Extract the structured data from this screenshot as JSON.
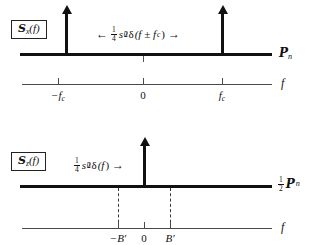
{
  "figure": {
    "background_color": "#ffffff",
    "ink_color": "#111111"
  },
  "panels": [
    {
      "id": "top",
      "label_box": {
        "script_letter": "S",
        "subscript": "x",
        "argument": "(f)",
        "full_text": "Sx(f)"
      },
      "annotation": {
        "left_arrow": "←",
        "right_arrow": "→",
        "numerator": "1",
        "denominator": "4",
        "symbol": "s",
        "symbol_subscript": "0",
        "symbol_superscript": "2",
        "delta": "δ",
        "delta_argument": "(f ± f",
        "delta_arg_subscript": "c",
        "delta_arg_close": ")",
        "full_text": "1/4 s0^2 δ(f ± fc)"
      },
      "level_label": {
        "script_letter": "P",
        "subscript": "n",
        "full_text": "Pn"
      },
      "impulses": [
        {
          "name": "impulse-negative-fc",
          "position_label": "-fc"
        },
        {
          "name": "impulse-positive-fc",
          "position_label": "fc"
        }
      ],
      "frequency_axis": {
        "name": "f",
        "ticks": [
          {
            "label": "−f",
            "subscript": "c",
            "full_text": "-fc"
          },
          {
            "label": "0",
            "subscript": "",
            "full_text": "0"
          },
          {
            "label": "f",
            "subscript": "c",
            "full_text": "fc"
          }
        ]
      }
    },
    {
      "id": "bottom",
      "label_box": {
        "script_letter": "S",
        "subscript": "z",
        "argument": "(f)",
        "full_text": "Sz(f)"
      },
      "annotation": {
        "left_arrow": "",
        "right_arrow": "→",
        "numerator": "1",
        "denominator": "4",
        "symbol": "s",
        "symbol_subscript": "0",
        "symbol_superscript": "2",
        "delta": "δ",
        "delta_argument": "(f",
        "delta_arg_subscript": "",
        "delta_arg_close": ")",
        "full_text": "1/4 s0^2 δ(f)"
      },
      "level_label": {
        "numerator": "1",
        "denominator": "2",
        "script_letter": "P",
        "subscript": "n",
        "full_text": "1/2 Pn"
      },
      "impulses": [
        {
          "name": "impulse-zero",
          "position_label": "0"
        }
      ],
      "frequency_axis": {
        "name": "f",
        "ticks": [
          {
            "label": "−B′",
            "subscript": "",
            "full_text": "-B'"
          },
          {
            "label": "0",
            "subscript": "",
            "full_text": "0"
          },
          {
            "label": "B′",
            "subscript": "",
            "full_text": "B'"
          }
        ]
      }
    }
  ]
}
